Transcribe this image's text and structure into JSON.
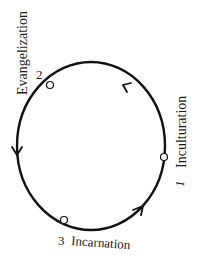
{
  "diagram": {
    "type": "cycle",
    "direction": "counter-clockwise",
    "stroke_color": "#111111",
    "background": "#ffffff",
    "nodes": [
      {
        "id": "1",
        "number": "1",
        "label": "Inculturation",
        "position": "right"
      },
      {
        "id": "2",
        "number": "2",
        "label": "Evangelization",
        "position": "upper-left"
      },
      {
        "id": "3",
        "number": "3",
        "label": "Incarnation",
        "position": "bottom"
      }
    ],
    "edges": [
      {
        "from": "1",
        "to": "2"
      },
      {
        "from": "2",
        "to": "3"
      },
      {
        "from": "3",
        "to": "1"
      }
    ]
  }
}
